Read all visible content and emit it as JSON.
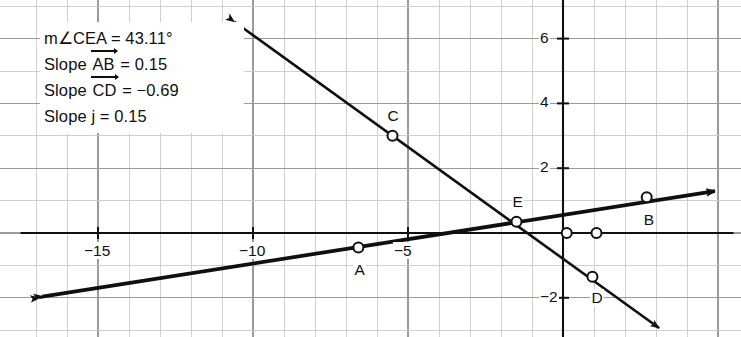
{
  "figure": {
    "type": "coordinate-geometry-construction",
    "background_color": "#ffffff",
    "ink_color": "#101010",
    "grid_color": "#9a9a9a",
    "minor_grid_color": "#c8c8c8"
  },
  "measurements": {
    "angle": {
      "prefix": "m∠CEA",
      "equals": "=",
      "value": "43.11°",
      "full": "m∠CEA = 43.11°"
    },
    "slope_ab": {
      "prefix": "Slope",
      "object": "AB",
      "equals": "=",
      "value": "0.15",
      "full": "Slope AB = 0.15"
    },
    "slope_cd": {
      "prefix": "Slope",
      "object": "CD",
      "equals": "=",
      "value": "−0.69",
      "full": "Slope CD = −0.69"
    },
    "slope_j": {
      "prefix": "Slope",
      "object": "j",
      "equals": "=",
      "value": "0.15",
      "full": "Slope j = 0.15"
    }
  },
  "chart_data": {
    "type": "scatter",
    "title": "",
    "xlabel": "",
    "ylabel": "",
    "xlim": [
      -17.5,
      5.5
    ],
    "ylim": [
      -3.2,
      7.1
    ],
    "grid": true,
    "grid_step": 1,
    "legend": "none",
    "x_tick_labels": [
      {
        "value": -15,
        "text": "−15"
      },
      {
        "value": -10,
        "text": "−10"
      },
      {
        "value": -5,
        "text": "−5"
      }
    ],
    "y_tick_labels": [
      {
        "value": 6,
        "text": "6"
      },
      {
        "value": 4,
        "text": "4"
      },
      {
        "value": 2,
        "text": "2"
      },
      {
        "value": -2,
        "text": "−2"
      }
    ],
    "points": [
      {
        "name": "A",
        "x": -6.6,
        "y": -0.45,
        "label_dx": 0,
        "label_dy": 22
      },
      {
        "name": "B",
        "x": 2.7,
        "y": 1.1,
        "label_dx": 1,
        "label_dy": 23
      },
      {
        "name": "C",
        "x": -5.5,
        "y": 3.0,
        "label_dx": -1,
        "label_dy": -20
      },
      {
        "name": "D",
        "x": 0.95,
        "y": -1.35,
        "label_dx": 3,
        "label_dy": 21
      },
      {
        "name": "E",
        "x": -1.5,
        "y": 0.35,
        "label_dx": 0,
        "label_dy": -20
      },
      {
        "name": "",
        "x": 0.12,
        "y": 0,
        "label_dx": 0,
        "label_dy": 0
      },
      {
        "name": "",
        "x": 1.08,
        "y": 0,
        "label_dx": 0,
        "label_dy": 0
      }
    ],
    "lines": [
      {
        "name": "AB",
        "slope": 0.15,
        "through": {
          "x": -6.6,
          "y": -0.45
        },
        "arrow_start": true,
        "arrow_end": true,
        "x_from": -16.9,
        "x_to": 4.9
      },
      {
        "name": "CD",
        "slope": -0.69,
        "through": {
          "x": -5.5,
          "y": 3.0
        },
        "arrow_start": true,
        "arrow_end": true,
        "x_from": -10.6,
        "x_to": 3.1
      },
      {
        "name": "j",
        "slope": 0.15,
        "through": {
          "x": -1.5,
          "y": 0.35
        },
        "arrow_start": true,
        "arrow_end": true,
        "x_from": -16.8,
        "x_to": 4.9
      },
      {
        "name": "x-axis",
        "slope": 0,
        "through": {
          "x": 0,
          "y": 0
        },
        "arrow_start": false,
        "arrow_end": false,
        "x_from": -16.6,
        "x_to": 4.6
      }
    ]
  }
}
